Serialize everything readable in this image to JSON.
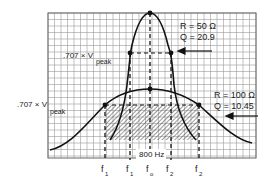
{
  "diagram": {
    "colors": {
      "grid": "#9a9a9a",
      "curve": "#111111",
      "hatch": "#555555",
      "background": "#ffffff"
    },
    "grid": {
      "x0": 48,
      "y0": 13,
      "x1": 256,
      "y1": 158,
      "step": 6.5
    },
    "narrow_curve": {
      "label_r": "R = 50 Ω",
      "label_q": "Q = 20.9",
      "peak": [
        150,
        13
      ],
      "half_power_left": [
        130,
        53
      ],
      "half_power_right": [
        171,
        53
      ]
    },
    "wide_curve": {
      "label_r": "R = 100 Ω",
      "label_q": "Q = 10.45",
      "peak": [
        150,
        89
      ],
      "half_power_left": [
        105,
        105
      ],
      "half_power_right": [
        199,
        105
      ]
    },
    "level_label_top": {
      "main": ".707 × V",
      "sub": "peak"
    },
    "level_label_bottom": {
      "main": ".707 × V",
      "sub": "peak"
    },
    "bandwidth_label": "800 Hz",
    "freq_labels": [
      {
        "main": "f",
        "sub": "1",
        "x": 104
      },
      {
        "main": "f",
        "sub": "1",
        "x": 128
      },
      {
        "main": "f",
        "sub": "o",
        "x": 149
      },
      {
        "main": "f",
        "sub": "2",
        "x": 169
      },
      {
        "main": "f",
        "sub": "2",
        "x": 198
      }
    ]
  }
}
